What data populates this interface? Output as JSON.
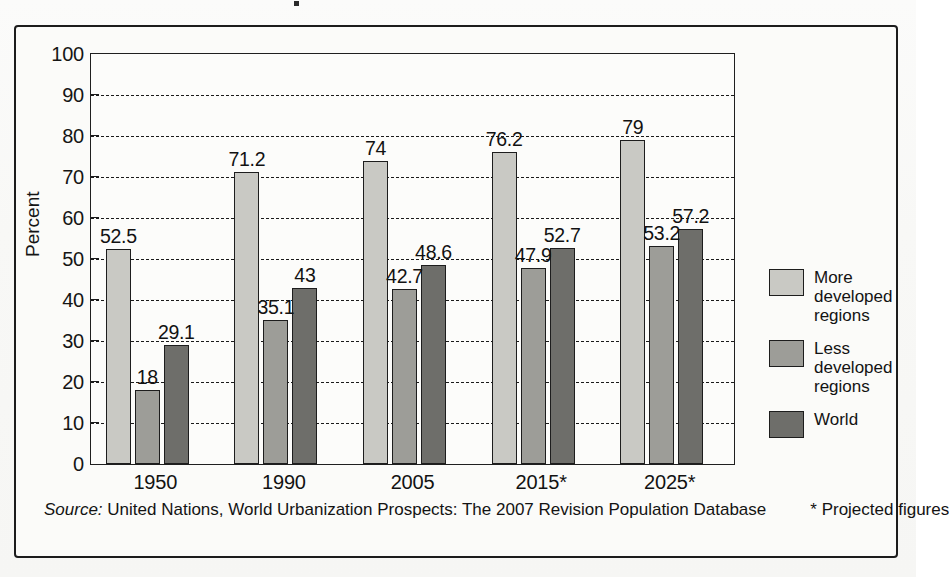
{
  "chart_data": {
    "type": "bar",
    "title": "",
    "xlabel": "",
    "ylabel": "Percent",
    "ylim": [
      0,
      100
    ],
    "ytick_step": 10,
    "yticks": [
      0,
      10,
      20,
      30,
      40,
      50,
      60,
      70,
      80,
      90,
      100
    ],
    "grid": "horizontal-dashed",
    "legend_position": "right",
    "categories": [
      "1950",
      "1990",
      "2005",
      "2015*",
      "2025*"
    ],
    "series": [
      {
        "name": "More developed regions",
        "color": "#c9c9c4",
        "values": [
          52.5,
          71.2,
          74,
          76.2,
          79
        ],
        "labels": [
          "52.5",
          "71.2",
          "74",
          "76.2",
          "79"
        ]
      },
      {
        "name": "Less developed regions",
        "color": "#9d9d98",
        "values": [
          18,
          35.1,
          42.7,
          47.9,
          53.2
        ],
        "labels": [
          "18",
          "35.1",
          "42.7",
          "47.9",
          "53.2"
        ]
      },
      {
        "name": "World",
        "color": "#6e6e6a",
        "values": [
          29.1,
          43,
          48.6,
          52.7,
          57.2
        ],
        "labels": [
          "29.1",
          "43",
          "48.6",
          "52.7",
          "57.2"
        ]
      }
    ]
  },
  "legend": {
    "items": [
      {
        "label": "More developed regions",
        "lines": [
          "More",
          "developed",
          "regions"
        ],
        "color": "#c9c9c4"
      },
      {
        "label": "Less developed regions",
        "lines": [
          "Less",
          "developed",
          "regions"
        ],
        "color": "#9d9d98"
      },
      {
        "label": "World",
        "lines": [
          "World"
        ],
        "color": "#6e6e6a"
      }
    ]
  },
  "footer": {
    "source_label": "Source:",
    "source_body": " United Nations, World Urbanization Prospects: The 2007 Revision Population Database",
    "projected_note": "* Projected figures"
  },
  "colors": {
    "more_developed": "#c9c9c4",
    "less_developed": "#9d9d98",
    "world": "#6e6e6a",
    "ink": "#1c1c1c",
    "paper": "#fbfbf9"
  }
}
